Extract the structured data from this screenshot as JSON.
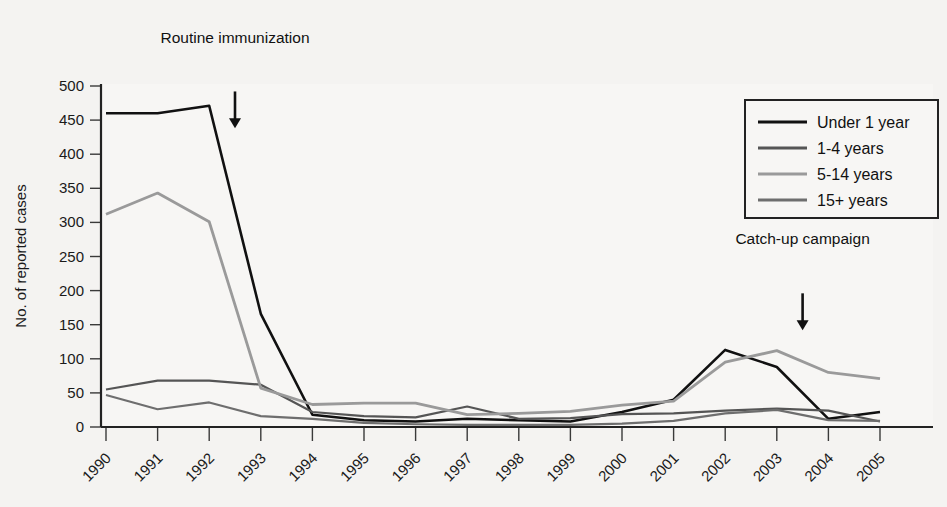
{
  "figure": {
    "background_color": "#f4f3f1",
    "plot_background_color": "#f7f6f4"
  },
  "chart_data": {
    "type": "line",
    "title": "",
    "xlabel": "",
    "ylabel": "No. of reported cases",
    "x": [
      1990,
      1991,
      1992,
      1993,
      1994,
      1995,
      1996,
      1997,
      1998,
      1999,
      2000,
      2001,
      2002,
      2003,
      2004,
      2005
    ],
    "categories": [
      "1990",
      "1991",
      "1992",
      "1993",
      "1994",
      "1995",
      "1996",
      "1997",
      "1998",
      "1999",
      "2000",
      "2001",
      "2002",
      "2003",
      "2004",
      "2005"
    ],
    "xlim": [
      1990,
      2005
    ],
    "ylim": [
      0,
      500
    ],
    "yticks": [
      0,
      50,
      100,
      150,
      200,
      250,
      300,
      350,
      400,
      450,
      500
    ],
    "ytick_labels": [
      "0",
      "50",
      "100",
      "150",
      "200",
      "250",
      "300",
      "350",
      "400",
      "450",
      "500"
    ],
    "grid": false,
    "legend_position": "top-right",
    "series": [
      {
        "name": "Under 1 year",
        "color": "#111111",
        "width": 2.6,
        "values": [
          460,
          460,
          471,
          166,
          18,
          10,
          8,
          12,
          10,
          8,
          22,
          40,
          113,
          88,
          12,
          22
        ]
      },
      {
        "name": "1-4 years",
        "color": "#555555",
        "width": 2.2,
        "values": [
          55,
          68,
          68,
          62,
          22,
          16,
          14,
          30,
          12,
          13,
          19,
          20,
          24,
          27,
          24,
          8
        ]
      },
      {
        "name": "5-14 years",
        "color": "#9a9a9a",
        "width": 2.8,
        "values": [
          312,
          343,
          301,
          57,
          33,
          35,
          35,
          18,
          20,
          23,
          32,
          38,
          95,
          112,
          80,
          71
        ]
      },
      {
        "name": "15+ years",
        "color": "#6e6e6e",
        "width": 2.2,
        "values": [
          47,
          26,
          36,
          16,
          12,
          6,
          4,
          3,
          3,
          3,
          5,
          9,
          20,
          25,
          10,
          9
        ]
      }
    ],
    "annotations": [
      {
        "label": "Routine immunization",
        "x": 1992.5,
        "text_y": 500,
        "arrow_from_y": 492,
        "arrow_to_y": 438
      },
      {
        "label": "Catch-up campaign",
        "x": 2003.5,
        "text_y": 205,
        "arrow_from_y": 196,
        "arrow_to_y": 142
      }
    ]
  },
  "legend": {
    "entries": [
      {
        "label": "Under 1 year"
      },
      {
        "label": "1-4 years"
      },
      {
        "label": "5-14 years"
      },
      {
        "label": "15+ years"
      }
    ]
  }
}
